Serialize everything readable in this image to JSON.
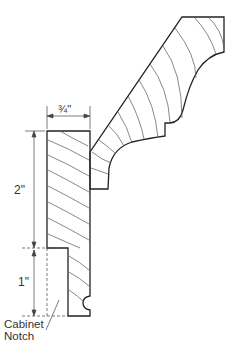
{
  "diagram": {
    "labels": {
      "width": "¾\"",
      "upper_height": "2\"",
      "notch_height": "1\"",
      "notch_line1": "Cabinet",
      "notch_line2": "Notch"
    },
    "colors": {
      "outline": "#222222",
      "grain": "#555555",
      "dimension": "#444444"
    }
  }
}
